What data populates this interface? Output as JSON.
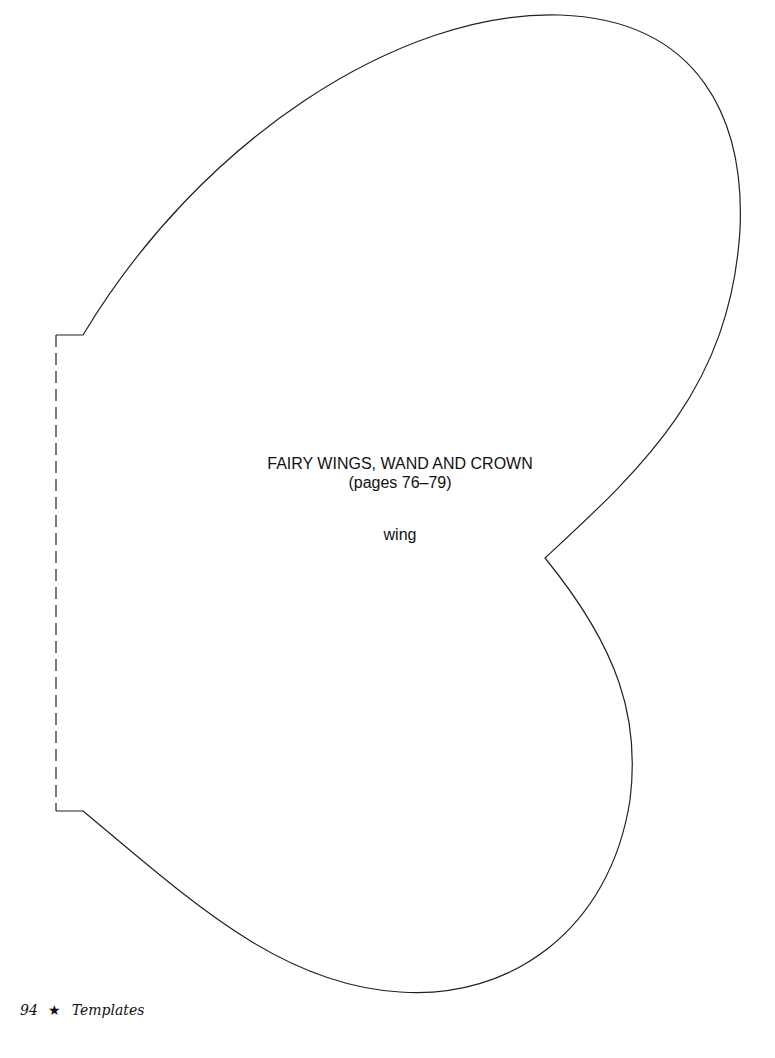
{
  "template": {
    "title": "FAIRY WINGS, WAND AND CROWN",
    "pages": "(pages 76–79)",
    "piece_label": "wing",
    "line_color": "#222222"
  },
  "footer": {
    "page_number": "94",
    "star_icon": "★",
    "section": "Templates"
  }
}
